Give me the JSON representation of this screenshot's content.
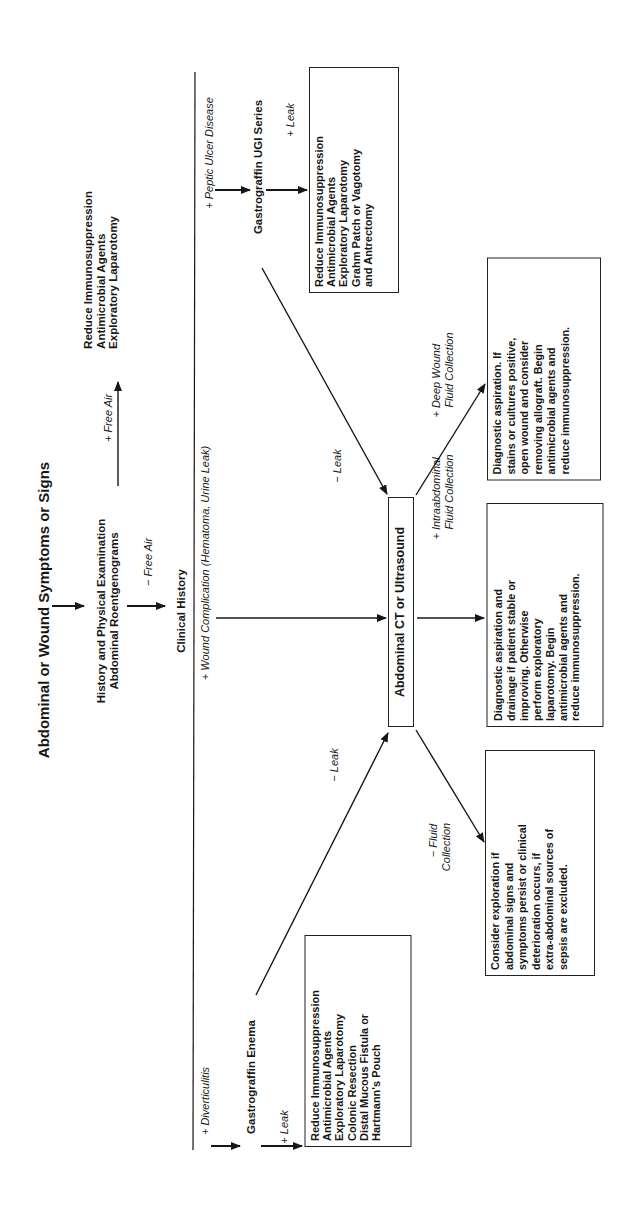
{
  "title": "Abdominal or Wound Symptoms or Signs",
  "nodes": {
    "history": [
      "History and Physical Examination",
      "Abdominal Roentgenograms"
    ],
    "clinical_history": "Clinical History",
    "ct": "Abdominal CT or Ultrasound",
    "ugi": "Gastrograffin UGI Series",
    "enema": "Gastrograffin Enema",
    "free_air_action": [
      "Reduce Immunosuppression",
      "Antimicrobial Agents",
      "Exploratory Laparotomy"
    ],
    "ugi_leak_action": [
      "Reduce Immunosuppression",
      "Antimicrobial Agents",
      "Exploratory Laparotomy",
      "Grahm Patch or Vagotomy",
      "and Antrectomy"
    ],
    "enema_leak_action": [
      "Reduce Immunosuppression",
      "Antimicrobial Agents",
      "Exploratory Laparotomy",
      "Colonic Resection",
      "Distal Mucous Fistula or",
      "Hartmann's Pouch"
    ],
    "deep_wound_action": [
      "Diagnostic aspiration. If",
      "stains or cultures positive,",
      "open wound and consider",
      "removing allograft. Begin",
      "antimicrobial agents and",
      "reduce immunosuppression."
    ],
    "intraabdominal_action": [
      "Diagnostic aspiration and",
      "drainage if patient stable or",
      "improving. Otherwise",
      "perform exploratory",
      "laparotomy. Begin",
      "antimicrobial agents and",
      "reduce immunosuppression."
    ],
    "no_fluid_action": [
      "Consider exploration if",
      "abdominal signs and",
      "symptoms persist or clinical",
      "deterioration occurs, if",
      "extra-abdominal sources of",
      "sepsis are excluded."
    ]
  },
  "edge_labels": {
    "plus_free_air": "+ Free Air",
    "minus_free_air": "− Free Air",
    "peptic_ulcer": "+ Peptic Ulcer Disease",
    "wound_complication_prefix": "+ Wound Complication (",
    "wound_complication_hematoma": "Hematoma,",
    "wound_complication_urine": "Urine Leak",
    "wound_complication_suffix": ")",
    "diverticulitis": "+ Diverticulitis",
    "ugi_plus_leak": "+ Leak",
    "enema_plus_leak": "+ Leak",
    "ugi_minus_leak": "− Leak",
    "enema_minus_leak": "− Leak",
    "deep_wound": [
      "+ Deep Wound",
      "Fluid Collection"
    ],
    "intraabdominal": [
      "+ Intraabdominal",
      "Fluid Collection"
    ],
    "no_fluid": [
      "− Fluid",
      "Collection"
    ]
  }
}
